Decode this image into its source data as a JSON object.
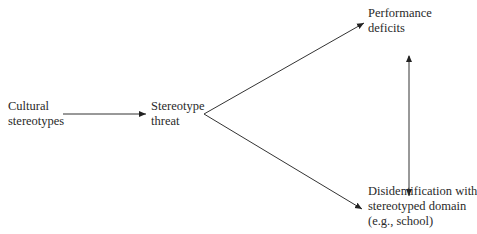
{
  "diagram": {
    "nodes": {
      "cultural_stereotypes": {
        "lines": [
          "Cultural",
          "stereotypes"
        ]
      },
      "stereotype_threat": {
        "lines": [
          "Stereotype",
          "threat"
        ]
      },
      "performance_deficits": {
        "lines": [
          "Performance",
          "deficits"
        ]
      },
      "disidentification": {
        "lines": [
          "Disidentification with",
          "stereotyped domain",
          "(e.g., school)"
        ]
      }
    },
    "edges": [
      {
        "from": "Cultural stereotypes",
        "to": "Stereotype threat",
        "type": "arrow"
      },
      {
        "from": "Stereotype threat",
        "to": "Performance deficits",
        "type": "arrow"
      },
      {
        "from": "Stereotype threat",
        "to": "Disidentification with stereotyped domain (e.g., school)",
        "type": "arrow"
      },
      {
        "from": "Performance deficits",
        "to": "Disidentification with stereotyped domain (e.g., school)",
        "type": "bidirectional-arrow"
      }
    ],
    "colors": {
      "line": "#333333",
      "text": "#2a2a2a"
    }
  }
}
